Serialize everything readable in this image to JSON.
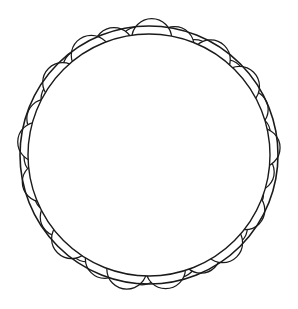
{
  "artwork": {
    "title": "Phyllotaxis Circle Mandala",
    "kind": "line-art-coloring-page",
    "canvas": {
      "width": 298,
      "height": 309
    },
    "background_color": "#ffffff",
    "stroke_color": "#1a1a1a",
    "fill_color": "#ffffff"
  },
  "outer_ring": {
    "name": "outer-boundary-circle",
    "center_x": 149,
    "center_y": 155,
    "radius": 129,
    "stroke_width": 1.6
  },
  "inner_ring": {
    "name": "inner-boundary-circle",
    "center_x": 149,
    "center_y": 155,
    "radius": 121,
    "stroke_width": 1.4
  },
  "phyllotaxis": {
    "name": "circle-spiral-field",
    "center_x": 149,
    "center_y": 155,
    "count": 186,
    "golden_angle_degrees": 137.507764,
    "radial_scale": 8.35,
    "radial_exponent": 0.5,
    "max_radius": 112,
    "dot_radius_base": 2.6,
    "dot_radius_growth": 0.155,
    "dot_radius_max": 22,
    "stroke_width": 1.25,
    "draw_order": "center-outward",
    "squash_y": 1.04
  },
  "legend": {
    "outer_ring_label": "Outer ring",
    "spiral_label": "Golden-angle spiral of circles",
    "center_label": "Spiral center"
  }
}
